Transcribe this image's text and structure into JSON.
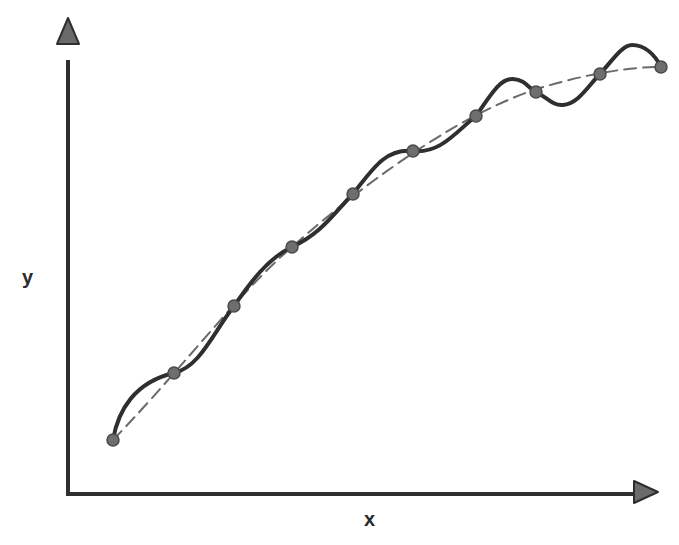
{
  "diagram": {
    "title": "",
    "axes": {
      "x_label": "x",
      "y_label": "y",
      "origin": [
        68,
        494
      ],
      "x_axis_end": [
        660,
        494
      ],
      "y_axis_end": [
        68,
        42
      ],
      "color": "#2f2f2f"
    },
    "data_points": [
      [
        113,
        440
      ],
      [
        174,
        373
      ],
      [
        234,
        306
      ],
      [
        292,
        247
      ],
      [
        353,
        194
      ],
      [
        413,
        151
      ],
      [
        476,
        116
      ],
      [
        536,
        92
      ],
      [
        600,
        74
      ],
      [
        661,
        67
      ]
    ],
    "point_style": {
      "radius": 6,
      "fill": "#6e6e6e",
      "stroke": "#4a4a4a"
    },
    "overfit_curve": {
      "description": "solid wavy curve passing through every data point",
      "color": "#2f2f2f",
      "width": 4,
      "path": "M113,440 C118,410 135,382 174,373 C200,367 213,333 234,306 C250,283 268,258 292,247 C322,233 333,214 353,194 C372,170 385,148 413,151 C440,154 456,132 476,116 C490,96 500,78 513,79 C526,80 528,88 536,92 C548,98 553,106 563,105 C578,104 588,86 600,74 C612,61 622,45 632,45 C645,45 655,55 661,67"
    },
    "trend_curve": {
      "description": "smooth dashed best-fit curve",
      "color": "#6a6a6a",
      "width": 2,
      "dash": "12,7",
      "path": "M113,440 C190,360 240,290 300,240 C380,170 470,110 540,88 C590,73 630,67 661,67"
    }
  }
}
